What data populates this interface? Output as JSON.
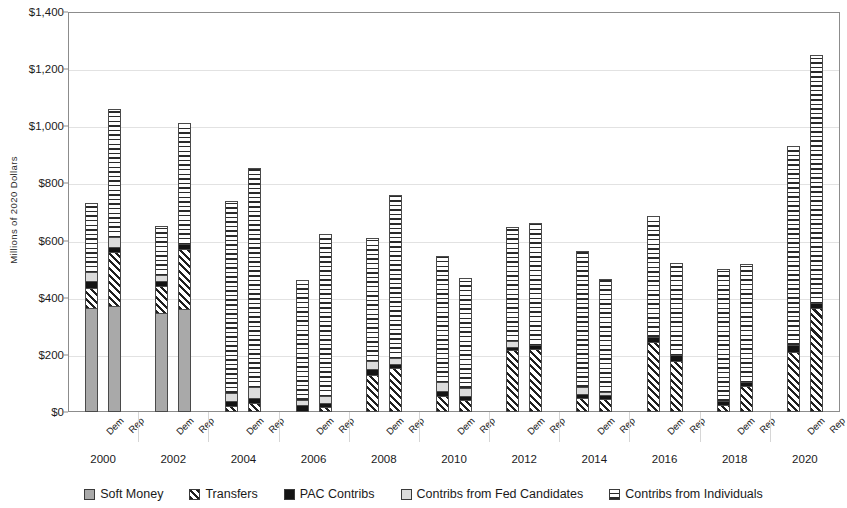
{
  "chart_data": {
    "type": "bar",
    "title": "",
    "subtitle": "",
    "xlabel": "",
    "ylabel": "Millions of 2020 Dollars",
    "ylim": [
      0,
      1400
    ],
    "ytick_step": 200,
    "ytick_labels": [
      "$0",
      "$200",
      "$400",
      "$600",
      "$800",
      "$1,000",
      "$1,200",
      "$1,400"
    ],
    "ytick_values": [
      0,
      200,
      400,
      600,
      800,
      1000,
      1200,
      1400
    ],
    "grid": true,
    "stacked": true,
    "legend_position": "bottom",
    "categories": [
      "2000",
      "2002",
      "2004",
      "2006",
      "2008",
      "2010",
      "2012",
      "2014",
      "2016",
      "2018",
      "2020"
    ],
    "subcategories": [
      "Dem",
      "Rep"
    ],
    "series": [
      {
        "name": "Soft Money",
        "pattern": "soft-money-dotted-gray",
        "values": {
          "2000": {
            "Dem": 363,
            "Rep": 372
          },
          "2002": {
            "Dem": 348,
            "Rep": 362
          },
          "2004": {
            "Dem": 0,
            "Rep": 0
          },
          "2006": {
            "Dem": 0,
            "Rep": 0
          },
          "2008": {
            "Dem": 0,
            "Rep": 0
          },
          "2010": {
            "Dem": 0,
            "Rep": 0
          },
          "2012": {
            "Dem": 0,
            "Rep": 0
          },
          "2014": {
            "Dem": 0,
            "Rep": 0
          },
          "2016": {
            "Dem": 0,
            "Rep": 0
          },
          "2018": {
            "Dem": 0,
            "Rep": 0
          },
          "2020": {
            "Dem": 0,
            "Rep": 0
          }
        }
      },
      {
        "name": "Transfers",
        "pattern": "diagonal-hatch",
        "values": {
          "2000": {
            "Dem": 72,
            "Rep": 187
          },
          "2002": {
            "Dem": 92,
            "Rep": 208
          },
          "2004": {
            "Dem": 22,
            "Rep": 30
          },
          "2006": {
            "Dem": 4,
            "Rep": 18
          },
          "2008": {
            "Dem": 130,
            "Rep": 155
          },
          "2010": {
            "Dem": 55,
            "Rep": 42
          },
          "2012": {
            "Dem": 218,
            "Rep": 222
          },
          "2014": {
            "Dem": 48,
            "Rep": 44
          },
          "2016": {
            "Dem": 245,
            "Rep": 180
          },
          "2018": {
            "Dem": 25,
            "Rep": 90
          },
          "2020": {
            "Dem": 210,
            "Rep": 365
          }
        }
      },
      {
        "name": "PAC Contribs",
        "pattern": "solid-black",
        "values": {
          "2000": {
            "Dem": 22,
            "Rep": 20
          },
          "2002": {
            "Dem": 20,
            "Rep": 18
          },
          "2004": {
            "Dem": 18,
            "Rep": 18
          },
          "2006": {
            "Dem": 20,
            "Rep": 15
          },
          "2008": {
            "Dem": 20,
            "Rep": 14
          },
          "2010": {
            "Dem": 17,
            "Rep": 15
          },
          "2012": {
            "Dem": 10,
            "Rep": 11
          },
          "2014": {
            "Dem": 15,
            "Rep": 14
          },
          "2016": {
            "Dem": 17,
            "Rep": 20
          },
          "2018": {
            "Dem": 15,
            "Rep": 15
          },
          "2020": {
            "Dem": 25,
            "Rep": 16
          }
        }
      },
      {
        "name": "Contribs from Fed Candidates",
        "pattern": "light-gray",
        "values": {
          "2000": {
            "Dem": 33,
            "Rep": 35
          },
          "2002": {
            "Dem": 18,
            "Rep": 0
          },
          "2004": {
            "Dem": 28,
            "Rep": 38
          },
          "2006": {
            "Dem": 18,
            "Rep": 23
          },
          "2008": {
            "Dem": 28,
            "Rep": 20
          },
          "2010": {
            "Dem": 33,
            "Rep": 28
          },
          "2012": {
            "Dem": 20,
            "Rep": 0
          },
          "2014": {
            "Dem": 23,
            "Rep": 12
          },
          "2016": {
            "Dem": 0,
            "Rep": 0
          },
          "2018": {
            "Dem": 0,
            "Rep": 0
          },
          "2020": {
            "Dem": 0,
            "Rep": 0
          }
        }
      },
      {
        "name": "Contribs from Individuals",
        "pattern": "horizontal-hatch",
        "values": {
          "2000": {
            "Dem": 240,
            "Rep": 446
          },
          "2002": {
            "Dem": 172,
            "Rep": 422
          },
          "2004": {
            "Dem": 672,
            "Rep": 767
          },
          "2006": {
            "Dem": 421,
            "Rep": 566
          },
          "2008": {
            "Dem": 430,
            "Rep": 571
          },
          "2010": {
            "Dem": 440,
            "Rep": 383
          },
          "2012": {
            "Dem": 400,
            "Rep": 427
          },
          "2014": {
            "Dem": 477,
            "Rep": 395
          },
          "2016": {
            "Dem": 423,
            "Rep": 320
          },
          "2018": {
            "Dem": 460,
            "Rep": 413
          },
          "2020": {
            "Dem": 695,
            "Rep": 869
          }
        }
      }
    ],
    "totals": {
      "2000": {
        "Dem": 730,
        "Rep": 1060
      },
      "2002": {
        "Dem": 650,
        "Rep": 1010
      },
      "2004": {
        "Dem": 740,
        "Rep": 853
      },
      "2006": {
        "Dem": 463,
        "Rep": 622
      },
      "2008": {
        "Dem": 608,
        "Rep": 760
      },
      "2010": {
        "Dem": 545,
        "Rep": 468
      },
      "2012": {
        "Dem": 648,
        "Rep": 660
      },
      "2014": {
        "Dem": 563,
        "Rep": 465
      },
      "2016": {
        "Dem": 685,
        "Rep": 520
      },
      "2018": {
        "Dem": 500,
        "Rep": 518
      },
      "2020": {
        "Dem": 930,
        "Rep": 1250
      }
    },
    "legend": [
      {
        "label": "Soft Money",
        "pattern": "soft-money-dotted-gray"
      },
      {
        "label": "Transfers",
        "pattern": "diagonal-hatch"
      },
      {
        "label": "PAC Contribs",
        "pattern": "solid-black"
      },
      {
        "label": "Contribs from Fed Candidates",
        "pattern": "light-gray"
      },
      {
        "label": "Contribs from Individuals",
        "pattern": "horizontal-hatch"
      }
    ]
  },
  "colors": {
    "soft_money": "#a9a9a9",
    "transfers": "#ffffff",
    "pac_contribs": "#141414",
    "fed_candidates": "#dcdcdc",
    "individuals": "#ffffff",
    "outline": "#4a4a4a",
    "gridline": "#e2e2e2",
    "axis": "#8c8c8c",
    "background": "#ffffff",
    "text": "#1a1a1a"
  }
}
